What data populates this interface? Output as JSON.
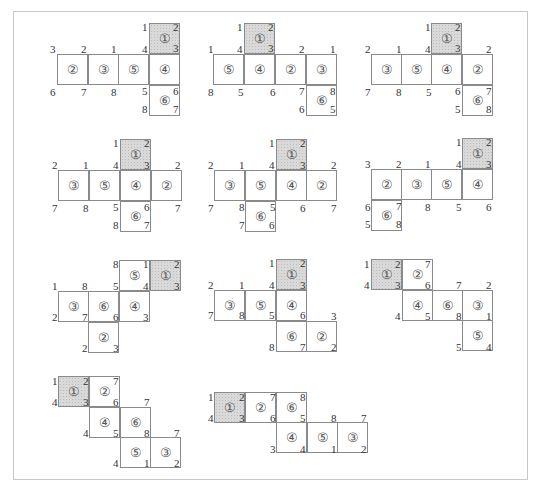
{
  "square_size": 31,
  "face_glyphs": {
    "1": "①",
    "2": "②",
    "3": "③",
    "4": "④",
    "5": "⑤",
    "6": "⑥"
  },
  "nets": [
    {
      "id": 1,
      "squares": [
        {
          "face": "1",
          "x": 149,
          "y": 23,
          "shaded": true
        },
        {
          "face": "2",
          "x": 57,
          "y": 54
        },
        {
          "face": "3",
          "x": 88,
          "y": 54
        },
        {
          "face": "5",
          "x": 118,
          "y": 54
        },
        {
          "face": "4",
          "x": 149,
          "y": 54
        },
        {
          "face": "6",
          "x": 149,
          "y": 85
        }
      ],
      "labels": [
        {
          "t": "1",
          "x": 142,
          "y": 22
        },
        {
          "t": "2",
          "x": 173,
          "y": 22
        },
        {
          "t": "3",
          "x": 173,
          "y": 43
        },
        {
          "t": "3",
          "x": 50,
          "y": 44
        },
        {
          "t": "2",
          "x": 81,
          "y": 44
        },
        {
          "t": "1",
          "x": 111,
          "y": 44
        },
        {
          "t": "4",
          "x": 142,
          "y": 44
        },
        {
          "t": "6",
          "x": 50,
          "y": 87
        },
        {
          "t": "7",
          "x": 81,
          "y": 87
        },
        {
          "t": "8",
          "x": 111,
          "y": 87
        },
        {
          "t": "5",
          "x": 142,
          "y": 86
        },
        {
          "t": "6",
          "x": 173,
          "y": 86
        },
        {
          "t": "8",
          "x": 142,
          "y": 104
        },
        {
          "t": "7",
          "x": 173,
          "y": 104
        }
      ]
    },
    {
      "id": 2,
      "squares": [
        {
          "face": "1",
          "x": 244,
          "y": 23,
          "shaded": true
        },
        {
          "face": "5",
          "x": 213,
          "y": 54
        },
        {
          "face": "4",
          "x": 244,
          "y": 54
        },
        {
          "face": "2",
          "x": 275,
          "y": 54
        },
        {
          "face": "3",
          "x": 306,
          "y": 54
        },
        {
          "face": "6",
          "x": 306,
          "y": 85
        }
      ],
      "labels": [
        {
          "t": "1",
          "x": 237,
          "y": 22
        },
        {
          "t": "2",
          "x": 268,
          "y": 22
        },
        {
          "t": "3",
          "x": 268,
          "y": 43
        },
        {
          "t": "1",
          "x": 208,
          "y": 44
        },
        {
          "t": "4",
          "x": 237,
          "y": 44
        },
        {
          "t": "2",
          "x": 299,
          "y": 44
        },
        {
          "t": "1",
          "x": 330,
          "y": 44
        },
        {
          "t": "8",
          "x": 208,
          "y": 87
        },
        {
          "t": "5",
          "x": 238,
          "y": 87
        },
        {
          "t": "6",
          "x": 270,
          "y": 87
        },
        {
          "t": "7",
          "x": 299,
          "y": 86
        },
        {
          "t": "8",
          "x": 330,
          "y": 86
        },
        {
          "t": "6",
          "x": 299,
          "y": 104
        },
        {
          "t": "5",
          "x": 330,
          "y": 104
        }
      ]
    },
    {
      "id": 3,
      "squares": [
        {
          "face": "1",
          "x": 431,
          "y": 23,
          "shaded": true
        },
        {
          "face": "3",
          "x": 371,
          "y": 54
        },
        {
          "face": "5",
          "x": 401,
          "y": 54
        },
        {
          "face": "4",
          "x": 431,
          "y": 54
        },
        {
          "face": "2",
          "x": 462,
          "y": 54
        },
        {
          "face": "6",
          "x": 462,
          "y": 85
        }
      ],
      "labels": [
        {
          "t": "1",
          "x": 425,
          "y": 22
        },
        {
          "t": "2",
          "x": 455,
          "y": 22
        },
        {
          "t": "3",
          "x": 455,
          "y": 43
        },
        {
          "t": "2",
          "x": 365,
          "y": 44
        },
        {
          "t": "1",
          "x": 396,
          "y": 44
        },
        {
          "t": "4",
          "x": 425,
          "y": 44
        },
        {
          "t": "2",
          "x": 486,
          "y": 44
        },
        {
          "t": "7",
          "x": 365,
          "y": 87
        },
        {
          "t": "8",
          "x": 396,
          "y": 87
        },
        {
          "t": "5",
          "x": 426,
          "y": 87
        },
        {
          "t": "6",
          "x": 455,
          "y": 86
        },
        {
          "t": "7",
          "x": 486,
          "y": 86
        },
        {
          "t": "5",
          "x": 455,
          "y": 104
        },
        {
          "t": "8",
          "x": 486,
          "y": 104
        }
      ]
    },
    {
      "id": 4,
      "squares": [
        {
          "face": "1",
          "x": 120,
          "y": 139,
          "shaded": true
        },
        {
          "face": "3",
          "x": 58,
          "y": 170
        },
        {
          "face": "5",
          "x": 89,
          "y": 170
        },
        {
          "face": "4",
          "x": 120,
          "y": 170
        },
        {
          "face": "2",
          "x": 151,
          "y": 170
        },
        {
          "face": "6",
          "x": 120,
          "y": 201
        }
      ],
      "labels": [
        {
          "t": "1",
          "x": 113,
          "y": 138
        },
        {
          "t": "2",
          "x": 144,
          "y": 138
        },
        {
          "t": "3",
          "x": 144,
          "y": 160
        },
        {
          "t": "2",
          "x": 52,
          "y": 160
        },
        {
          "t": "1",
          "x": 83,
          "y": 160
        },
        {
          "t": "4",
          "x": 113,
          "y": 160
        },
        {
          "t": "2",
          "x": 175,
          "y": 160
        },
        {
          "t": "7",
          "x": 52,
          "y": 203
        },
        {
          "t": "8",
          "x": 83,
          "y": 203
        },
        {
          "t": "5",
          "x": 113,
          "y": 202
        },
        {
          "t": "6",
          "x": 144,
          "y": 202
        },
        {
          "t": "7",
          "x": 175,
          "y": 203
        },
        {
          "t": "8",
          "x": 113,
          "y": 220
        },
        {
          "t": "7",
          "x": 144,
          "y": 220
        }
      ]
    },
    {
      "id": 5,
      "squares": [
        {
          "face": "1",
          "x": 276,
          "y": 139,
          "shaded": true
        },
        {
          "face": "3",
          "x": 214,
          "y": 170
        },
        {
          "face": "5",
          "x": 245,
          "y": 170
        },
        {
          "face": "4",
          "x": 276,
          "y": 170
        },
        {
          "face": "2",
          "x": 306,
          "y": 170
        },
        {
          "face": "6",
          "x": 245,
          "y": 201
        }
      ],
      "labels": [
        {
          "t": "1",
          "x": 269,
          "y": 138
        },
        {
          "t": "2",
          "x": 300,
          "y": 138
        },
        {
          "t": "3",
          "x": 300,
          "y": 160
        },
        {
          "t": "2",
          "x": 208,
          "y": 160
        },
        {
          "t": "1",
          "x": 239,
          "y": 160
        },
        {
          "t": "4",
          "x": 269,
          "y": 160
        },
        {
          "t": "2",
          "x": 331,
          "y": 160
        },
        {
          "t": "7",
          "x": 208,
          "y": 203
        },
        {
          "t": "8",
          "x": 239,
          "y": 202
        },
        {
          "t": "5",
          "x": 270,
          "y": 202
        },
        {
          "t": "6",
          "x": 300,
          "y": 203
        },
        {
          "t": "7",
          "x": 331,
          "y": 203
        },
        {
          "t": "7",
          "x": 239,
          "y": 220
        },
        {
          "t": "6",
          "x": 269,
          "y": 220
        }
      ]
    },
    {
      "id": 6,
      "squares": [
        {
          "face": "1",
          "x": 462,
          "y": 138,
          "shaded": true
        },
        {
          "face": "2",
          "x": 371,
          "y": 169
        },
        {
          "face": "3",
          "x": 401,
          "y": 169
        },
        {
          "face": "5",
          "x": 431,
          "y": 169
        },
        {
          "face": "4",
          "x": 462,
          "y": 169
        },
        {
          "face": "6",
          "x": 371,
          "y": 200
        }
      ],
      "labels": [
        {
          "t": "1",
          "x": 456,
          "y": 137
        },
        {
          "t": "2",
          "x": 486,
          "y": 137
        },
        {
          "t": "3",
          "x": 486,
          "y": 159
        },
        {
          "t": "3",
          "x": 365,
          "y": 159
        },
        {
          "t": "2",
          "x": 396,
          "y": 159
        },
        {
          "t": "1",
          "x": 425,
          "y": 159
        },
        {
          "t": "4",
          "x": 456,
          "y": 159
        },
        {
          "t": "6",
          "x": 365,
          "y": 202
        },
        {
          "t": "7",
          "x": 396,
          "y": 201
        },
        {
          "t": "8",
          "x": 425,
          "y": 202
        },
        {
          "t": "5",
          "x": 456,
          "y": 202
        },
        {
          "t": "6",
          "x": 486,
          "y": 202
        },
        {
          "t": "5",
          "x": 365,
          "y": 219
        },
        {
          "t": "8",
          "x": 396,
          "y": 219
        }
      ]
    },
    {
      "id": 7,
      "squares": [
        {
          "face": "5",
          "x": 119,
          "y": 260
        },
        {
          "face": "1",
          "x": 150,
          "y": 260,
          "shaded": true
        },
        {
          "face": "3",
          "x": 58,
          "y": 291
        },
        {
          "face": "6",
          "x": 88,
          "y": 291
        },
        {
          "face": "4",
          "x": 119,
          "y": 291
        },
        {
          "face": "2",
          "x": 88,
          "y": 322
        }
      ],
      "labels": [
        {
          "t": "8",
          "x": 113,
          "y": 259
        },
        {
          "t": "1",
          "x": 143,
          "y": 259
        },
        {
          "t": "2",
          "x": 174,
          "y": 259
        },
        {
          "t": "4",
          "x": 143,
          "y": 281
        },
        {
          "t": "3",
          "x": 174,
          "y": 281
        },
        {
          "t": "1",
          "x": 52,
          "y": 281
        },
        {
          "t": "8",
          "x": 82,
          "y": 281
        },
        {
          "t": "5",
          "x": 113,
          "y": 281
        },
        {
          "t": "2",
          "x": 52,
          "y": 312
        },
        {
          "t": "7",
          "x": 82,
          "y": 312
        },
        {
          "t": "6",
          "x": 113,
          "y": 312
        },
        {
          "t": "3",
          "x": 143,
          "y": 312
        },
        {
          "t": "2",
          "x": 82,
          "y": 343
        },
        {
          "t": "3",
          "x": 113,
          "y": 343
        }
      ]
    },
    {
      "id": 8,
      "squares": [
        {
          "face": "1",
          "x": 276,
          "y": 259,
          "shaded": true
        },
        {
          "face": "3",
          "x": 214,
          "y": 290
        },
        {
          "face": "5",
          "x": 245,
          "y": 290
        },
        {
          "face": "4",
          "x": 276,
          "y": 290
        },
        {
          "face": "6",
          "x": 276,
          "y": 321
        },
        {
          "face": "2",
          "x": 306,
          "y": 321
        }
      ],
      "labels": [
        {
          "t": "1",
          "x": 269,
          "y": 258
        },
        {
          "t": "2",
          "x": 300,
          "y": 258
        },
        {
          "t": "3",
          "x": 300,
          "y": 280
        },
        {
          "t": "2",
          "x": 208,
          "y": 280
        },
        {
          "t": "1",
          "x": 239,
          "y": 280
        },
        {
          "t": "4",
          "x": 269,
          "y": 280
        },
        {
          "t": "7",
          "x": 208,
          "y": 310
        },
        {
          "t": "8",
          "x": 239,
          "y": 310
        },
        {
          "t": "5",
          "x": 269,
          "y": 310
        },
        {
          "t": "6",
          "x": 300,
          "y": 310
        },
        {
          "t": "3",
          "x": 331,
          "y": 311
        },
        {
          "t": "8",
          "x": 269,
          "y": 342
        },
        {
          "t": "7",
          "x": 300,
          "y": 342
        },
        {
          "t": "2",
          "x": 331,
          "y": 342
        }
      ]
    },
    {
      "id": 9,
      "squares": [
        {
          "face": "1",
          "x": 371,
          "y": 259,
          "shaded": true
        },
        {
          "face": "2",
          "x": 402,
          "y": 259
        },
        {
          "face": "4",
          "x": 402,
          "y": 290
        },
        {
          "face": "6",
          "x": 432,
          "y": 290
        },
        {
          "face": "3",
          "x": 462,
          "y": 290
        },
        {
          "face": "5",
          "x": 462,
          "y": 320
        }
      ],
      "labels": [
        {
          "t": "1",
          "x": 364,
          "y": 259
        },
        {
          "t": "2",
          "x": 395,
          "y": 259
        },
        {
          "t": "7",
          "x": 425,
          "y": 259
        },
        {
          "t": "4",
          "x": 364,
          "y": 280
        },
        {
          "t": "3",
          "x": 395,
          "y": 280
        },
        {
          "t": "6",
          "x": 425,
          "y": 280
        },
        {
          "t": "7",
          "x": 456,
          "y": 280
        },
        {
          "t": "2",
          "x": 486,
          "y": 280
        },
        {
          "t": "4",
          "x": 395,
          "y": 311
        },
        {
          "t": "5",
          "x": 425,
          "y": 311
        },
        {
          "t": "8",
          "x": 456,
          "y": 311
        },
        {
          "t": "1",
          "x": 486,
          "y": 311
        },
        {
          "t": "5",
          "x": 456,
          "y": 342
        },
        {
          "t": "4",
          "x": 486,
          "y": 342
        }
      ]
    },
    {
      "id": 10,
      "squares": [
        {
          "face": "1",
          "x": 58,
          "y": 376,
          "shaded": true
        },
        {
          "face": "2",
          "x": 89,
          "y": 376
        },
        {
          "face": "4",
          "x": 89,
          "y": 407
        },
        {
          "face": "6",
          "x": 120,
          "y": 407
        },
        {
          "face": "5",
          "x": 120,
          "y": 437
        },
        {
          "face": "3",
          "x": 150,
          "y": 437
        }
      ],
      "labels": [
        {
          "t": "1",
          "x": 52,
          "y": 376
        },
        {
          "t": "2",
          "x": 83,
          "y": 376
        },
        {
          "t": "7",
          "x": 113,
          "y": 376
        },
        {
          "t": "4",
          "x": 52,
          "y": 397
        },
        {
          "t": "3",
          "x": 83,
          "y": 397
        },
        {
          "t": "6",
          "x": 113,
          "y": 397
        },
        {
          "t": "7",
          "x": 144,
          "y": 397
        },
        {
          "t": "4",
          "x": 83,
          "y": 428
        },
        {
          "t": "5",
          "x": 113,
          "y": 428
        },
        {
          "t": "8",
          "x": 144,
          "y": 428
        },
        {
          "t": "7",
          "x": 174,
          "y": 428
        },
        {
          "t": "4",
          "x": 113,
          "y": 458
        },
        {
          "t": "1",
          "x": 144,
          "y": 458
        },
        {
          "t": "2",
          "x": 174,
          "y": 458
        }
      ]
    },
    {
      "id": 11,
      "squares": [
        {
          "face": "1",
          "x": 214,
          "y": 392,
          "shaded": true
        },
        {
          "face": "2",
          "x": 245,
          "y": 392
        },
        {
          "face": "6",
          "x": 276,
          "y": 392
        },
        {
          "face": "4",
          "x": 276,
          "y": 422
        },
        {
          "face": "5",
          "x": 307,
          "y": 422
        },
        {
          "face": "3",
          "x": 337,
          "y": 422
        }
      ],
      "labels": [
        {
          "t": "1",
          "x": 208,
          "y": 392
        },
        {
          "t": "2",
          "x": 239,
          "y": 392
        },
        {
          "t": "7",
          "x": 270,
          "y": 392
        },
        {
          "t": "8",
          "x": 300,
          "y": 392
        },
        {
          "t": "4",
          "x": 208,
          "y": 413
        },
        {
          "t": "3",
          "x": 239,
          "y": 413
        },
        {
          "t": "6",
          "x": 270,
          "y": 413
        },
        {
          "t": "5",
          "x": 300,
          "y": 413
        },
        {
          "t": "8",
          "x": 331,
          "y": 413
        },
        {
          "t": "7",
          "x": 361,
          "y": 413
        },
        {
          "t": "3",
          "x": 270,
          "y": 444
        },
        {
          "t": "4",
          "x": 300,
          "y": 444
        },
        {
          "t": "1",
          "x": 331,
          "y": 444
        },
        {
          "t": "2",
          "x": 361,
          "y": 444
        }
      ]
    }
  ]
}
